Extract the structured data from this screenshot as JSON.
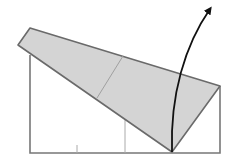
{
  "diagram": {
    "type": "origami-fold-step",
    "colors": {
      "paper_outline": "#777777",
      "flap_fill": "#d4d4d4",
      "flap_stroke": "#6a6a6a",
      "crease": "#aaaaaa",
      "arrow": "#111111",
      "background": "#ffffff"
    },
    "base_rectangle": {
      "left_x": 30,
      "right_x": 220,
      "bottom_y": 153,
      "left_top_y": 55,
      "right_top_y": 86
    },
    "flap_polygon": [
      [
        30,
        28
      ],
      [
        220,
        86
      ],
      [
        172,
        152
      ],
      [
        18,
        45
      ]
    ],
    "flap_crease": [
      [
        123,
        56
      ],
      [
        97,
        98
      ]
    ],
    "inner_crease_lines": [
      [
        [
          125,
          100
        ],
        [
          125,
          153
        ]
      ],
      [
        [
          77,
          145
        ],
        [
          77,
          153
        ]
      ]
    ],
    "fold_arrow": {
      "start": [
        172,
        152
      ],
      "control1": [
        170,
        95
      ],
      "control2": [
        185,
        45
      ],
      "end": [
        210,
        9
      ]
    }
  }
}
